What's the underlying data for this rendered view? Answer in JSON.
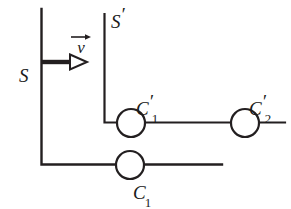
{
  "figure": {
    "kind": "physics-diagram",
    "background_color": "#ffffff",
    "ink_color": "#231f20",
    "labels": {
      "frame_rest": "S",
      "frame_moving_base": "S",
      "frame_moving_prime": "′",
      "velocity": "v",
      "clock1_base": "C",
      "clock1_prime": "′",
      "clock1_sub": "1",
      "clock2_base": "C",
      "clock2_prime": "′",
      "clock2_sub": "2",
      "clock_rest_base": "C",
      "clock_rest_sub": "1"
    },
    "elements": {
      "s_axis": {
        "name": "S frame axis",
        "x": 41,
        "y_top": 9,
        "y_bottom": 165
      },
      "s_baseline": {
        "name": "S frame baseline",
        "y": 165,
        "x_left": 41,
        "x_right": 222
      },
      "sprime_axis": {
        "name": "S-prime frame axis",
        "x": 104,
        "y_top": 14,
        "y_bottom": 123
      },
      "sprime_baseline": {
        "name": "S-prime frame baseline",
        "y": 123,
        "x_left": 104,
        "x_right": 285
      },
      "velocity_arrow": {
        "name": "velocity arrow",
        "y": 62,
        "x_start": 42,
        "x_end": 87
      },
      "clock_c1_prime": {
        "cx": 131,
        "cy": 123,
        "r": 14
      },
      "clock_c2_prime": {
        "cx": 245,
        "cy": 123,
        "r": 14
      },
      "clock_c1": {
        "cx": 130,
        "cy": 165,
        "r": 14
      }
    }
  }
}
